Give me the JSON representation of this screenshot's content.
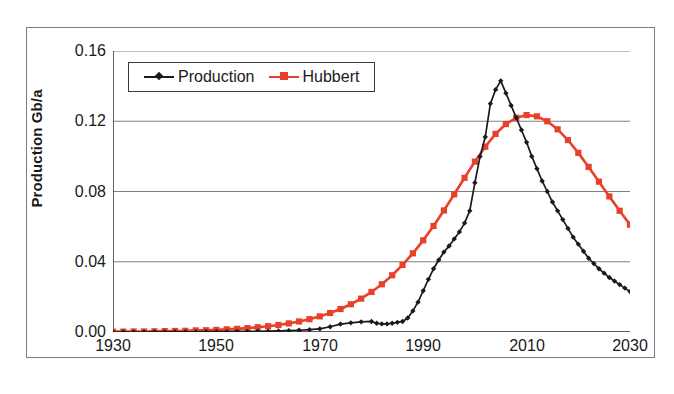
{
  "chart_data": {
    "type": "line",
    "title": "",
    "xlabel": "",
    "ylabel": "Production Gb/a",
    "xlim": [
      1930,
      2030
    ],
    "ylim": [
      0.0,
      0.16
    ],
    "xticks": [
      1930,
      1950,
      1970,
      1990,
      2010,
      2030
    ],
    "xtick_labels": [
      "1930",
      "1950",
      "1970",
      "1990",
      "2010",
      "2030"
    ],
    "yticks": [
      0.0,
      0.04,
      0.08,
      0.12,
      0.16
    ],
    "ytick_labels": [
      "0.00",
      "0.04",
      "0.08",
      "0.12",
      "0.16"
    ],
    "grid": "horizontal",
    "legend_position": "upper-left-inside",
    "colors": {
      "production": "#1a1a1a",
      "hubbert": "#e8402a",
      "gridline": "#808080",
      "axis": "#3a3a3a",
      "frame": "#7d7d7d"
    },
    "series": [
      {
        "name": "Production",
        "color": "#1a1a1a",
        "marker": "diamond",
        "x": [
          1930,
          1932,
          1934,
          1936,
          1938,
          1940,
          1942,
          1944,
          1946,
          1948,
          1950,
          1952,
          1954,
          1956,
          1958,
          1960,
          1962,
          1964,
          1966,
          1968,
          1970,
          1972,
          1974,
          1976,
          1978,
          1980,
          1981,
          1982,
          1983,
          1984,
          1985,
          1986,
          1987,
          1988,
          1989,
          1990,
          1991,
          1992,
          1993,
          1994,
          1995,
          1996,
          1997,
          1998,
          1999,
          2000,
          2001,
          2002,
          2003,
          2004,
          2005,
          2006,
          2007,
          2008,
          2009,
          2010,
          2011,
          2012,
          2013,
          2014,
          2015,
          2016,
          2017,
          2018,
          2019,
          2020,
          2021,
          2022,
          2023,
          2024,
          2025,
          2026,
          2027,
          2028,
          2029,
          2030
        ],
        "y": [
          0.0,
          0.0,
          0.0,
          0.0,
          0.0001,
          0.0001,
          0.0001,
          0.0001,
          0.0001,
          0.0002,
          0.0002,
          0.0002,
          0.0003,
          0.0003,
          0.0004,
          0.0005,
          0.0006,
          0.0008,
          0.001,
          0.0013,
          0.0018,
          0.003,
          0.0045,
          0.0052,
          0.0058,
          0.006,
          0.005,
          0.0046,
          0.0046,
          0.005,
          0.0055,
          0.006,
          0.008,
          0.012,
          0.017,
          0.0235,
          0.03,
          0.036,
          0.041,
          0.0455,
          0.049,
          0.053,
          0.057,
          0.062,
          0.069,
          0.085,
          0.1,
          0.111,
          0.13,
          0.138,
          0.143,
          0.136,
          0.129,
          0.122,
          0.115,
          0.108,
          0.1,
          0.093,
          0.086,
          0.08,
          0.074,
          0.069,
          0.064,
          0.059,
          0.054,
          0.05,
          0.046,
          0.042,
          0.039,
          0.036,
          0.0335,
          0.031,
          0.029,
          0.027,
          0.025,
          0.023
        ]
      },
      {
        "name": "Hubbert",
        "color": "#e8402a",
        "marker": "square",
        "x": [
          1930,
          1932,
          1934,
          1936,
          1938,
          1940,
          1942,
          1944,
          1946,
          1948,
          1950,
          1952,
          1954,
          1956,
          1958,
          1960,
          1962,
          1964,
          1966,
          1968,
          1970,
          1972,
          1974,
          1976,
          1978,
          1980,
          1982,
          1984,
          1986,
          1988,
          1990,
          1992,
          1994,
          1996,
          1998,
          2000,
          2002,
          2004,
          2006,
          2008,
          2010,
          2012,
          2014,
          2016,
          2018,
          2020,
          2022,
          2024,
          2026,
          2028,
          2030
        ],
        "y": [
          0.0002,
          0.0002,
          0.0003,
          0.0003,
          0.0004,
          0.0005,
          0.0006,
          0.0007,
          0.0009,
          0.001,
          0.0012,
          0.0015,
          0.0018,
          0.0022,
          0.0027,
          0.0033,
          0.004,
          0.0049,
          0.006,
          0.0073,
          0.0089,
          0.0108,
          0.0131,
          0.0158,
          0.019,
          0.0228,
          0.0272,
          0.0323,
          0.0382,
          0.0448,
          0.0522,
          0.0604,
          0.0692,
          0.0784,
          0.0878,
          0.097,
          0.1055,
          0.1128,
          0.1184,
          0.122,
          0.1235,
          0.1228,
          0.12,
          0.1154,
          0.1093,
          0.102,
          0.094,
          0.0856,
          0.0772,
          0.069,
          0.0611
        ]
      }
    ],
    "annotations": []
  },
  "legend": {
    "entries": [
      {
        "label": "Production",
        "marker": "diamond-marker",
        "color": "#1a1a1a"
      },
      {
        "label": "Hubbert",
        "marker": "square-marker",
        "color": "#e8402a"
      }
    ]
  },
  "axes": {
    "y_title": "Production Gb/a",
    "y_labels": [
      "0.16",
      "0.12",
      "0.08",
      "0.04",
      "0.00"
    ],
    "x_labels": [
      "1930",
      "1950",
      "1970",
      "1990",
      "2010",
      "2030"
    ]
  }
}
